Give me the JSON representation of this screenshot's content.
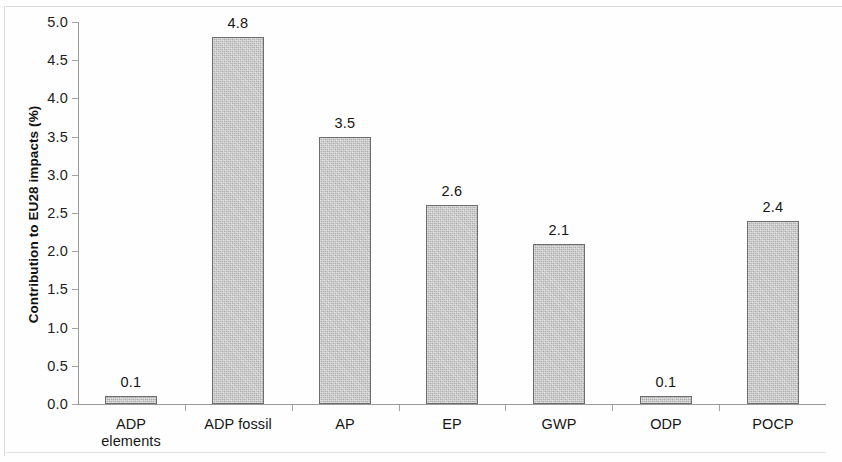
{
  "chart_data": {
    "type": "bar",
    "title": "",
    "xlabel": "",
    "ylabel": "Contribution to EU28 impacts (%)",
    "categories": [
      "ADP elements",
      "ADP fossil",
      "AP",
      "EP",
      "GWP",
      "ODP",
      "POCP"
    ],
    "category_lines": [
      [
        "ADP",
        "elements"
      ],
      [
        "ADP fossil"
      ],
      [
        "AP"
      ],
      [
        "EP"
      ],
      [
        "GWP"
      ],
      [
        "ODP"
      ],
      [
        "POCP"
      ]
    ],
    "values": [
      0.1,
      4.8,
      3.5,
      2.6,
      2.1,
      0.1,
      2.4
    ],
    "value_labels": [
      "0.1",
      "4.8",
      "3.5",
      "2.6",
      "2.1",
      "0.1",
      "2.4"
    ],
    "ylim": [
      0.0,
      5.0
    ],
    "ytick_values": [
      5.0,
      4.5,
      4.0,
      3.5,
      3.0,
      2.5,
      2.0,
      1.5,
      1.0,
      0.5,
      0.0
    ],
    "ytick_labels": [
      "5.0",
      "4.5",
      "4.0",
      "3.5",
      "3.0",
      "2.5",
      "2.0",
      "1.5",
      "1.0",
      "0.5",
      "0.0"
    ],
    "grid": false,
    "legend": "none",
    "bar_fill_color": "#c6c6c6",
    "bar_border_color": "#6d6d6d",
    "axis_color": "#9a9a98",
    "background_color": "#ffffff"
  }
}
